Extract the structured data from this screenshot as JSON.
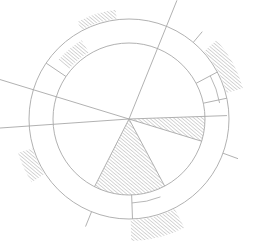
{
  "diagram": {
    "title": "",
    "width": 259,
    "height": 247,
    "center": [
      129,
      119
    ],
    "colors": {
      "background": "#ffffff",
      "stroke": "#a8a8a8",
      "hatch": "#9a9a9a"
    },
    "rings": [
      {
        "name": "inner-circle",
        "r": 76
      },
      {
        "name": "outer-circle",
        "r": 100
      }
    ],
    "rays": [
      {
        "name": "ray-top-right",
        "angle": -68,
        "r0": 0,
        "r1": 128
      },
      {
        "name": "ray-upper-left",
        "angle": -163,
        "r0": 0,
        "r1": 135
      },
      {
        "name": "ray-left",
        "angle": 176,
        "r0": 0,
        "r1": 130
      },
      {
        "name": "ray-right",
        "angle": -2,
        "r0": 0,
        "r1": 98
      },
      {
        "name": "ray-wedge1-end",
        "angle": 17,
        "r0": 0,
        "r1": 76
      },
      {
        "name": "ray-wedge2-start",
        "angle": 62,
        "r0": 0,
        "r1": 76
      },
      {
        "name": "ray-wedge2-end",
        "angle": 117,
        "r0": 0,
        "r1": 76
      },
      {
        "name": "tick-right-upper",
        "angle": -50,
        "r0": 100,
        "r1": 114
      },
      {
        "name": "tick-right-lower",
        "angle": 20,
        "r0": 100,
        "r1": 116
      },
      {
        "name": "tick-bottom-left",
        "angle": 112,
        "r0": 100,
        "r1": 116
      },
      {
        "name": "divider-upper-left",
        "angle": -146,
        "r0": 76,
        "r1": 100
      },
      {
        "name": "divider-right-1",
        "angle": -28,
        "r0": 76,
        "r1": 100
      },
      {
        "name": "divider-right-2",
        "angle": -12,
        "r0": 76,
        "r1": 100
      },
      {
        "name": "divider-bottom",
        "angle": 88,
        "r0": 76,
        "r1": 100
      }
    ],
    "hatched_sectors": [
      {
        "name": "inner-wedge-right",
        "a0": -2,
        "a1": 17,
        "r0": 0,
        "r1": 76
      },
      {
        "name": "inner-wedge-bottom",
        "a0": 62,
        "a1": 117,
        "r0": 0,
        "r1": 76
      },
      {
        "name": "band-upper-left",
        "a0": -140,
        "a1": -121,
        "r0": 78,
        "r1": 92
      },
      {
        "name": "outer-top",
        "a0": -118,
        "a1": -97,
        "r0": 101,
        "r1": 110
      },
      {
        "name": "outer-right",
        "a0": -42,
        "a1": -15,
        "r0": 101,
        "r1": 118
      },
      {
        "name": "outer-left",
        "a0": 147,
        "a1": 163,
        "r0": 101,
        "r1": 116
      },
      {
        "name": "outer-bottom",
        "a0": 63,
        "a1": 89,
        "r0": 101,
        "r1": 122
      }
    ],
    "inner_arcs": [
      {
        "name": "band-arc-right",
        "a0": -28,
        "a1": -10,
        "r": 92
      },
      {
        "name": "band-arc-bottom",
        "a0": 68,
        "a1": 88,
        "r": 84
      }
    ]
  }
}
